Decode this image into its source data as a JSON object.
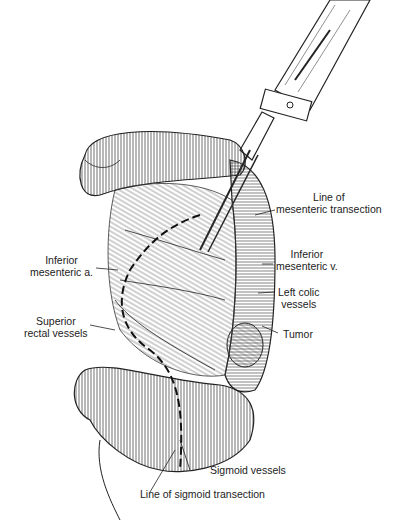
{
  "figure": {
    "type": "surgical illustration"
  },
  "labels": {
    "line_mesenteric_1": "Line of",
    "line_mesenteric_2": "mesenteric transection",
    "inf_mes_a_1": "Inferior",
    "inf_mes_a_2": "mesenteric a.",
    "inf_mes_v_1": "Inferior",
    "inf_mes_v_2": "mesenteric v.",
    "left_colic_1": "Left colic",
    "left_colic_2": "vessels",
    "tumor": "Tumor",
    "sup_rectal_1": "Superior",
    "sup_rectal_2": "rectal vessels",
    "sigmoid_vessels": "Sigmoid vessels",
    "line_sigmoid": "Line of sigmoid transection"
  },
  "colors": {
    "ink": "#222222",
    "background": "#ffffff"
  }
}
